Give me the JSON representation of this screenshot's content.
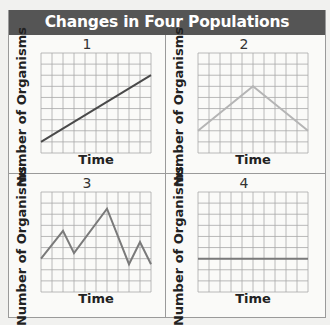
{
  "title": "Changes in Four Populations",
  "colors": {
    "header_bg": "#555555",
    "grid": "#a8a8a8",
    "line_dark": "#4a4a4a",
    "line_light": "#b5b5b5",
    "line_mid": "#7a7a7a"
  },
  "panels": [
    {
      "number": "1",
      "ylabel": "Number of Organisms",
      "xlabel": "Time"
    },
    {
      "number": "2",
      "ylabel": "Number of Organisms",
      "xlabel": "Time"
    },
    {
      "number": "3",
      "ylabel": "Number of Organisms",
      "xlabel": "Time"
    },
    {
      "number": "4",
      "ylabel": "Number of Organisms",
      "xlabel": "Time"
    }
  ],
  "chart_data": [
    {
      "type": "line",
      "title": "1",
      "xlabel": "Time",
      "ylabel": "Number of Organisms",
      "grid": true,
      "grid_cols": 10,
      "grid_rows": 9,
      "x": [
        0,
        10
      ],
      "values": [
        1,
        7
      ],
      "description": "Steady linear increase"
    },
    {
      "type": "line",
      "title": "2",
      "xlabel": "Time",
      "ylabel": "Number of Organisms",
      "grid": true,
      "grid_cols": 10,
      "grid_rows": 9,
      "x": [
        0,
        5,
        10
      ],
      "values": [
        2,
        6,
        2
      ],
      "description": "Increase then decrease"
    },
    {
      "type": "line",
      "title": "3",
      "xlabel": "Time",
      "ylabel": "Number of Organisms",
      "grid": true,
      "grid_cols": 10,
      "grid_rows": 9,
      "x": [
        0,
        2,
        3,
        6,
        8,
        9,
        10
      ],
      "values": [
        3,
        5.5,
        3.5,
        7.5,
        2.5,
        4.5,
        2.5
      ],
      "description": "Irregular fluctuation"
    },
    {
      "type": "line",
      "title": "4",
      "xlabel": "Time",
      "ylabel": "Number of Organisms",
      "grid": true,
      "grid_cols": 10,
      "grid_rows": 9,
      "x": [
        0,
        10
      ],
      "values": [
        3,
        3
      ],
      "description": "Constant population"
    }
  ]
}
